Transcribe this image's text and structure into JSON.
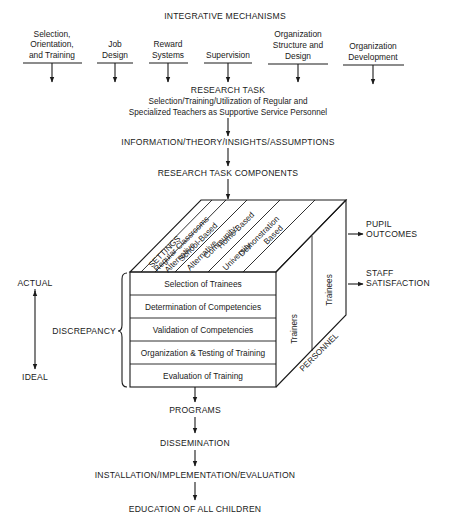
{
  "header": {
    "title": "INTEGRATIVE MECHANISMS"
  },
  "mechanisms": [
    {
      "lines": [
        "Selection,",
        "Orientation,",
        "and Training"
      ]
    },
    {
      "lines": [
        "Job",
        "Design"
      ]
    },
    {
      "lines": [
        "Reward",
        "Systems"
      ]
    },
    {
      "lines": [
        "Supervision"
      ]
    },
    {
      "lines": [
        "Organization",
        "Structure and",
        "Design"
      ]
    },
    {
      "lines": [
        "Organization",
        "Development"
      ]
    }
  ],
  "research_task": {
    "title": "RESEARCH TASK",
    "line1": "Selection/Training/Utilization of Regular and",
    "line2": "Specialized Teachers as Supportive Service Personnel"
  },
  "info": "INFORMATION/THEORY/INSIGHTS/ASSUMPTIONS",
  "components": "RESEARCH TASK COMPONENTS",
  "cube": {
    "settings_label": "SETTINGS",
    "settings": [
      {
        "lines": [
          "Regular Classrooms"
        ]
      },
      {
        "lines": [
          "Alternative",
          "School-Based"
        ]
      },
      {
        "lines": [
          "Alternative",
          "Community-",
          "Home-Based"
        ]
      },
      {
        "lines": [
          "University",
          "Demonstration",
          "Based"
        ]
      }
    ],
    "rows": [
      "Selection of Trainees",
      "Determination of Competencies",
      "Validation of Competencies",
      "Organization & Testing of Training",
      "Evaluation of Training"
    ],
    "personnel_label": "PERSONNEL",
    "personnel": [
      "Trainers",
      "Trainees"
    ]
  },
  "outcomes": {
    "pupil": [
      "PUPIL",
      "OUTCOMES"
    ],
    "staff": [
      "STAFF",
      "SATISFACTION"
    ]
  },
  "scale": {
    "top": "ACTUAL",
    "bottom": "IDEAL",
    "discrepancy": "DISCREPANCY"
  },
  "flow": [
    "PROGRAMS",
    "DISSEMINATION",
    "INSTALLATION/IMPLEMENTATION/EVALUATION",
    "EDUCATION OF ALL CHILDREN"
  ]
}
